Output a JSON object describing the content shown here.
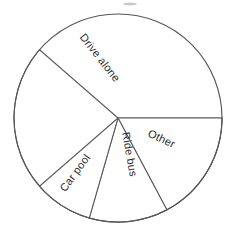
{
  "chart_data": {
    "type": "pie",
    "title": "",
    "subtitle": "",
    "xlabel": "",
    "ylabel": "",
    "legend_position": "none",
    "grid": false,
    "labels_inside_slices": true,
    "categories": [
      "Drive alone",
      "Other",
      "Ride bus",
      "Car pool"
    ],
    "values": [
      61.4,
      17.2,
      12.2,
      9.2
    ],
    "units": "percent",
    "start_angle_deg": 90,
    "direction": "clockwise",
    "slices": [
      {
        "label": "Drive alone",
        "value": 61.4,
        "angle_deg": 221,
        "start_angle_deg": 90,
        "end_angle_deg": 311,
        "label_rotation_deg": 52,
        "label_x": 97,
        "label_y": 60
      },
      {
        "label": "Other",
        "value": 17.2,
        "angle_deg": 62,
        "start_angle_deg": 90,
        "end_angle_deg": 152,
        "label_rotation_deg": 25,
        "label_x": 160,
        "label_y": 142
      },
      {
        "label": "Ride bus",
        "value": 12.2,
        "angle_deg": 44,
        "start_angle_deg": 152,
        "end_angle_deg": 196,
        "label_rotation_deg": 80,
        "label_x": 126,
        "label_y": 155
      },
      {
        "label": "Car pool",
        "value": 9.2,
        "angle_deg": 33,
        "start_angle_deg": 196,
        "end_angle_deg": 229,
        "label_rotation_deg": -54,
        "label_x": 78,
        "label_y": 175
      }
    ],
    "geometry": {
      "center_x": 118,
      "center_y": 118,
      "radius": 104
    },
    "colors": {
      "slice_fill": "#ffffff",
      "slice_stroke": "#5a5a5a",
      "outline_stroke": "#55555a",
      "label_text": "#2c2c2c",
      "background": "#ffffff"
    }
  }
}
